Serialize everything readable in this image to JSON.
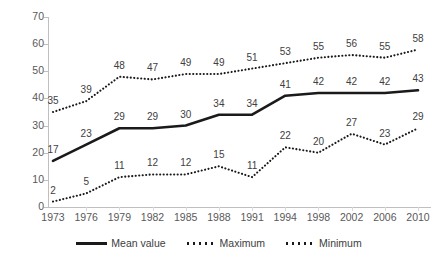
{
  "chart_data": {
    "type": "line",
    "title": "",
    "subtitle": "",
    "xlabel": "",
    "ylabel": "",
    "xlim_categories": true,
    "ylim": [
      0,
      70
    ],
    "ytick_step": 10,
    "grid": false,
    "legend_position": "bottom-center",
    "categories": [
      "1973",
      "1976",
      "1979",
      "1982",
      "1985",
      "1988",
      "1991",
      "1994",
      "1998",
      "2002",
      "2006",
      "2010"
    ],
    "yticks": [
      "0",
      "10",
      "20",
      "30",
      "40",
      "50",
      "60",
      "70"
    ],
    "series": [
      {
        "name": "Mean value",
        "style": "solid",
        "color": "#1a1a1a",
        "values": [
          17,
          23,
          29,
          29,
          30,
          34,
          34,
          41,
          42,
          42,
          42,
          43
        ],
        "labels": [
          "17",
          "23",
          "29",
          "29",
          "30",
          "34",
          "34",
          "41",
          "42",
          "42",
          "42",
          "43"
        ]
      },
      {
        "name": "Maximum",
        "style": "dotted",
        "color": "#1a1a1a",
        "values": [
          35,
          39,
          48,
          47,
          49,
          49,
          51,
          53,
          55,
          56,
          55,
          58
        ],
        "labels": [
          "35",
          "39",
          "48",
          "47",
          "49",
          "49",
          "51",
          "53",
          "55",
          "56",
          "55",
          "58"
        ]
      },
      {
        "name": "Minimum",
        "style": "dotted",
        "color": "#1a1a1a",
        "values": [
          2,
          5,
          11,
          12,
          12,
          15,
          11,
          22,
          20,
          27,
          23,
          29
        ],
        "labels": [
          "2",
          "5",
          "11",
          "12",
          "12",
          "15",
          "11",
          "22",
          "20",
          "27",
          "23",
          "29"
        ]
      }
    ]
  },
  "legend": {
    "entries": [
      {
        "label": "Mean value",
        "marker": "solid-line-swatch"
      },
      {
        "label": "Maximum",
        "marker": "dotted-line-swatch"
      },
      {
        "label": "Minimum",
        "marker": "dotted-line-swatch"
      }
    ]
  }
}
